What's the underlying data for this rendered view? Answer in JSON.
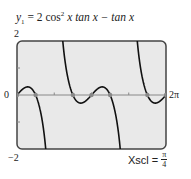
{
  "chart_data": {
    "type": "line",
    "title_parts": {
      "lhs": "y",
      "sub": "1",
      "rhs_text": " = 2 cos",
      "sup": "2",
      "rest": " x tan x − tan x"
    },
    "function": "2*cos(x)^2*tan(x) - tan(x)",
    "xlabel": "",
    "ylabel": "",
    "xlim": [
      0,
      6.2832
    ],
    "ylim": [
      -2,
      2
    ],
    "x_tick_labels": {
      "left": "0",
      "right": "2π"
    },
    "y_tick_labels": {
      "top": "2",
      "bottom": "−2"
    },
    "xscl": {
      "label": "Xscl =",
      "num": "π",
      "den": "4"
    },
    "yscl": 1,
    "asymptotes": [
      1.5708,
      4.7124
    ],
    "zeros_highlighted": [
      0,
      0.7854,
      2.3562,
      3.1416,
      3.927,
      5.4978,
      6.2832
    ],
    "grid": false,
    "colors": {
      "frame_bg": "#e9e9e9",
      "curve": "#111111",
      "axis": "#888888",
      "frame": "#444444",
      "zero_marker": "#888888"
    }
  }
}
